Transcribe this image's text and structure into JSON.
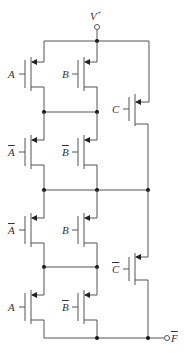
{
  "diagram": {
    "supply_label": "V",
    "supply_sup": "+",
    "output_label": "F",
    "caption": "",
    "colors": {
      "wire": "#555555",
      "text": "#333333",
      "background": "#ffffff"
    },
    "transistors": [
      {
        "id": "t1",
        "gate": "A",
        "inverted": false
      },
      {
        "id": "t2",
        "gate": "B",
        "inverted": false
      },
      {
        "id": "t3",
        "gate": "C",
        "inverted": false
      },
      {
        "id": "t4",
        "gate": "A",
        "inverted": true
      },
      {
        "id": "t5",
        "gate": "B",
        "inverted": true
      },
      {
        "id": "t6",
        "gate": "A",
        "inverted": true
      },
      {
        "id": "t7",
        "gate": "B",
        "inverted": false
      },
      {
        "id": "t8",
        "gate": "C",
        "inverted": true
      },
      {
        "id": "t9",
        "gate": "A",
        "inverted": false
      },
      {
        "id": "t10",
        "gate": "B",
        "inverted": true
      }
    ]
  }
}
